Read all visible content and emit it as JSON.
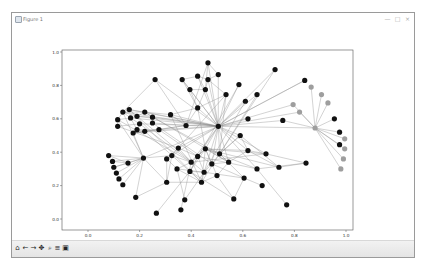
{
  "window": {
    "title": "Figure 1",
    "controls": {
      "minimize": "—",
      "maximize": "□",
      "close": "×"
    }
  },
  "toolbar": {
    "buttons": [
      {
        "name": "home",
        "icon": "home-icon",
        "glyph": "⌂"
      },
      {
        "name": "back",
        "icon": "back-arrow-icon",
        "glyph": "←"
      },
      {
        "name": "forward",
        "icon": "forward-arrow-icon",
        "glyph": "→"
      },
      {
        "name": "pan",
        "icon": "pan-icon",
        "glyph": "✥"
      },
      {
        "name": "zoom",
        "icon": "zoom-icon",
        "glyph": "⌕"
      },
      {
        "name": "subplots",
        "icon": "subplots-configure-icon",
        "glyph": "≡"
      },
      {
        "name": "save",
        "icon": "save-icon",
        "glyph": "▣"
      }
    ]
  },
  "colors": {
    "node_dark": "#111111",
    "node_gray": "#9e9e9e",
    "edge": "#8c8c8c",
    "axes_frame": "#555555"
  },
  "chart_data": {
    "type": "scatter",
    "title": "",
    "xlabel": "",
    "ylabel": "",
    "xlim": [
      -0.1,
      1.03
    ],
    "ylim": [
      -0.06,
      1.01
    ],
    "xticks": [
      "0.0",
      "0.2",
      "0.4",
      "0.6",
      "0.8",
      "1.0"
    ],
    "yticks": [
      "0.0",
      "0.2",
      "0.4",
      "0.6",
      "0.8",
      "1.0"
    ],
    "grid": false,
    "legend": null,
    "nodes": [
      {
        "id": 0,
        "x": 0.505,
        "y": 0.555,
        "color": "dark"
      },
      {
        "id": 1,
        "x": 0.465,
        "y": 0.935,
        "color": "dark"
      },
      {
        "id": 2,
        "x": 0.365,
        "y": 0.835,
        "color": "dark"
      },
      {
        "id": 3,
        "x": 0.425,
        "y": 0.855,
        "color": "dark"
      },
      {
        "id": 4,
        "x": 0.505,
        "y": 0.865,
        "color": "dark"
      },
      {
        "id": 5,
        "x": 0.395,
        "y": 0.775,
        "color": "dark"
      },
      {
        "id": 6,
        "x": 0.465,
        "y": 0.835,
        "color": "dark"
      },
      {
        "id": 7,
        "x": 0.455,
        "y": 0.775,
        "color": "dark"
      },
      {
        "id": 8,
        "x": 0.26,
        "y": 0.835,
        "color": "dark"
      },
      {
        "id": 9,
        "x": 0.425,
        "y": 0.665,
        "color": "dark"
      },
      {
        "id": 10,
        "x": 0.585,
        "y": 0.805,
        "color": "dark"
      },
      {
        "id": 11,
        "x": 0.61,
        "y": 0.705,
        "color": "dark"
      },
      {
        "id": 12,
        "x": 0.725,
        "y": 0.895,
        "color": "dark"
      },
      {
        "id": 13,
        "x": 0.655,
        "y": 0.745,
        "color": "dark"
      },
      {
        "id": 14,
        "x": 0.535,
        "y": 0.745,
        "color": "dark"
      },
      {
        "id": 15,
        "x": 0.84,
        "y": 0.83,
        "color": "dark"
      },
      {
        "id": 16,
        "x": 0.455,
        "y": 0.42,
        "color": "dark"
      },
      {
        "id": 17,
        "x": 0.62,
        "y": 0.6,
        "color": "dark"
      },
      {
        "id": 18,
        "x": 0.755,
        "y": 0.59,
        "color": "dark"
      },
      {
        "id": 19,
        "x": 0.62,
        "y": 0.41,
        "color": "dark"
      },
      {
        "id": 20,
        "x": 0.59,
        "y": 0.5,
        "color": "dark"
      },
      {
        "id": 21,
        "x": 0.08,
        "y": 0.38,
        "color": "dark"
      },
      {
        "id": 22,
        "x": 0.095,
        "y": 0.345,
        "color": "dark"
      },
      {
        "id": 23,
        "x": 0.1,
        "y": 0.31,
        "color": "dark"
      },
      {
        "id": 24,
        "x": 0.11,
        "y": 0.275,
        "color": "dark"
      },
      {
        "id": 25,
        "x": 0.12,
        "y": 0.24,
        "color": "dark"
      },
      {
        "id": 26,
        "x": 0.135,
        "y": 0.205,
        "color": "dark"
      },
      {
        "id": 27,
        "x": 0.155,
        "y": 0.335,
        "color": "dark"
      },
      {
        "id": 28,
        "x": 0.215,
        "y": 0.365,
        "color": "dark"
      },
      {
        "id": 29,
        "x": 0.175,
        "y": 0.515,
        "color": "dark"
      },
      {
        "id": 30,
        "x": 0.325,
        "y": 0.38,
        "color": "dark"
      },
      {
        "id": 31,
        "x": 0.185,
        "y": 0.13,
        "color": "dark"
      },
      {
        "id": 32,
        "x": 0.265,
        "y": 0.035,
        "color": "dark"
      },
      {
        "id": 33,
        "x": 0.36,
        "y": 0.055,
        "color": "dark"
      },
      {
        "id": 34,
        "x": 0.375,
        "y": 0.115,
        "color": "dark"
      },
      {
        "id": 35,
        "x": 0.305,
        "y": 0.22,
        "color": "dark"
      },
      {
        "id": 36,
        "x": 0.69,
        "y": 0.39,
        "color": "dark"
      },
      {
        "id": 37,
        "x": 0.74,
        "y": 0.31,
        "color": "dark"
      },
      {
        "id": 38,
        "x": 0.655,
        "y": 0.3,
        "color": "dark"
      },
      {
        "id": 39,
        "x": 0.845,
        "y": 0.335,
        "color": "dark"
      },
      {
        "id": 40,
        "x": 0.675,
        "y": 0.2,
        "color": "dark"
      },
      {
        "id": 41,
        "x": 0.605,
        "y": 0.245,
        "color": "dark"
      },
      {
        "id": 42,
        "x": 0.565,
        "y": 0.12,
        "color": "dark"
      },
      {
        "id": 43,
        "x": 0.77,
        "y": 0.085,
        "color": "dark"
      },
      {
        "id": 44,
        "x": 0.135,
        "y": 0.64,
        "color": "dark"
      },
      {
        "id": 45,
        "x": 0.16,
        "y": 0.655,
        "color": "dark"
      },
      {
        "id": 46,
        "x": 0.115,
        "y": 0.595,
        "color": "dark"
      },
      {
        "id": 47,
        "x": 0.115,
        "y": 0.555,
        "color": "dark"
      },
      {
        "id": 48,
        "x": 0.165,
        "y": 0.605,
        "color": "dark"
      },
      {
        "id": 49,
        "x": 0.19,
        "y": 0.615,
        "color": "dark"
      },
      {
        "id": 50,
        "x": 0.22,
        "y": 0.64,
        "color": "dark"
      },
      {
        "id": 51,
        "x": 0.25,
        "y": 0.61,
        "color": "dark"
      },
      {
        "id": 52,
        "x": 0.2,
        "y": 0.57,
        "color": "dark"
      },
      {
        "id": 53,
        "x": 0.19,
        "y": 0.535,
        "color": "dark"
      },
      {
        "id": 54,
        "x": 0.25,
        "y": 0.575,
        "color": "dark"
      },
      {
        "id": 55,
        "x": 0.32,
        "y": 0.625,
        "color": "dark"
      },
      {
        "id": 56,
        "x": 0.38,
        "y": 0.56,
        "color": "dark"
      },
      {
        "id": 57,
        "x": 0.275,
        "y": 0.535,
        "color": "dark"
      },
      {
        "id": 58,
        "x": 0.22,
        "y": 0.525,
        "color": "dark"
      },
      {
        "id": 59,
        "x": 0.35,
        "y": 0.425,
        "color": "dark"
      },
      {
        "id": 60,
        "x": 0.4,
        "y": 0.34,
        "color": "dark"
      },
      {
        "id": 61,
        "x": 0.425,
        "y": 0.375,
        "color": "dark"
      },
      {
        "id": 62,
        "x": 0.395,
        "y": 0.285,
        "color": "dark"
      },
      {
        "id": 63,
        "x": 0.45,
        "y": 0.28,
        "color": "dark"
      },
      {
        "id": 64,
        "x": 0.44,
        "y": 0.22,
        "color": "dark"
      },
      {
        "id": 65,
        "x": 0.48,
        "y": 0.33,
        "color": "dark"
      },
      {
        "id": 66,
        "x": 0.51,
        "y": 0.39,
        "color": "dark"
      },
      {
        "id": 67,
        "x": 0.545,
        "y": 0.34,
        "color": "dark"
      },
      {
        "id": 68,
        "x": 0.5,
        "y": 0.26,
        "color": "dark"
      },
      {
        "id": 69,
        "x": 0.305,
        "y": 0.36,
        "color": "dark"
      },
      {
        "id": 70,
        "x": 0.345,
        "y": 0.3,
        "color": "dark"
      },
      {
        "id": 71,
        "x": 0.975,
        "y": 0.445,
        "color": "dark"
      },
      {
        "id": 72,
        "x": 0.975,
        "y": 0.52,
        "color": "dark"
      },
      {
        "id": 73,
        "x": 0.955,
        "y": 0.6,
        "color": "dark"
      },
      {
        "id": 74,
        "x": 0.88,
        "y": 0.545,
        "color": "gray"
      },
      {
        "id": 75,
        "x": 0.795,
        "y": 0.685,
        "color": "gray"
      },
      {
        "id": 76,
        "x": 0.82,
        "y": 0.64,
        "color": "gray"
      },
      {
        "id": 77,
        "x": 0.865,
        "y": 0.79,
        "color": "gray"
      },
      {
        "id": 78,
        "x": 0.905,
        "y": 0.745,
        "color": "gray"
      },
      {
        "id": 79,
        "x": 0.93,
        "y": 0.695,
        "color": "gray"
      },
      {
        "id": 80,
        "x": 0.995,
        "y": 0.48,
        "color": "gray"
      },
      {
        "id": 81,
        "x": 0.995,
        "y": 0.42,
        "color": "gray"
      },
      {
        "id": 82,
        "x": 0.99,
        "y": 0.36,
        "color": "gray"
      },
      {
        "id": 83,
        "x": 0.98,
        "y": 0.3,
        "color": "gray"
      }
    ],
    "edges": [
      [
        0,
        1
      ],
      [
        0,
        2
      ],
      [
        0,
        3
      ],
      [
        0,
        4
      ],
      [
        0,
        5
      ],
      [
        0,
        6
      ],
      [
        0,
        7
      ],
      [
        0,
        8
      ],
      [
        0,
        9
      ],
      [
        0,
        10
      ],
      [
        0,
        11
      ],
      [
        0,
        12
      ],
      [
        0,
        13
      ],
      [
        0,
        14
      ],
      [
        0,
        15
      ],
      [
        0,
        16
      ],
      [
        0,
        17
      ],
      [
        0,
        18
      ],
      [
        0,
        19
      ],
      [
        0,
        20
      ],
      [
        0,
        29
      ],
      [
        0,
        44
      ],
      [
        0,
        45
      ],
      [
        0,
        48
      ],
      [
        0,
        49
      ],
      [
        0,
        50
      ],
      [
        0,
        51
      ],
      [
        0,
        52
      ],
      [
        0,
        55
      ],
      [
        0,
        56
      ],
      [
        0,
        57
      ],
      [
        0,
        59
      ],
      [
        0,
        61
      ],
      [
        0,
        66
      ],
      [
        0,
        67
      ],
      [
        0,
        74
      ],
      [
        0,
        75
      ],
      [
        0,
        76
      ],
      [
        0,
        28
      ],
      [
        0,
        30
      ],
      [
        0,
        36
      ],
      [
        0,
        38
      ],
      [
        0,
        60
      ],
      [
        0,
        63
      ],
      [
        0,
        65
      ],
      [
        74,
        77
      ],
      [
        74,
        78
      ],
      [
        74,
        79
      ],
      [
        74,
        73
      ],
      [
        74,
        72
      ],
      [
        74,
        80
      ],
      [
        74,
        81
      ],
      [
        74,
        82
      ],
      [
        74,
        83
      ],
      [
        74,
        71
      ],
      [
        74,
        18
      ],
      [
        74,
        75
      ],
      [
        74,
        76
      ],
      [
        28,
        21
      ],
      [
        28,
        22
      ],
      [
        28,
        23
      ],
      [
        28,
        24
      ],
      [
        28,
        25
      ],
      [
        28,
        26
      ],
      [
        28,
        27
      ],
      [
        28,
        29
      ],
      [
        28,
        30
      ],
      [
        28,
        31
      ],
      [
        28,
        35
      ],
      [
        28,
        44
      ],
      [
        28,
        46
      ],
      [
        27,
        21
      ],
      [
        27,
        22
      ],
      [
        27,
        23
      ],
      [
        30,
        35
      ],
      [
        30,
        59
      ],
      [
        30,
        60
      ],
      [
        35,
        31
      ],
      [
        35,
        64
      ],
      [
        32,
        62
      ],
      [
        33,
        60
      ],
      [
        34,
        63
      ],
      [
        34,
        70
      ],
      [
        16,
        36
      ],
      [
        16,
        37
      ],
      [
        16,
        38
      ],
      [
        16,
        19
      ],
      [
        16,
        60
      ],
      [
        16,
        61
      ],
      [
        16,
        62
      ],
      [
        16,
        64
      ],
      [
        16,
        65
      ],
      [
        16,
        66
      ],
      [
        16,
        67
      ],
      [
        16,
        68
      ],
      [
        19,
        37
      ],
      [
        19,
        36
      ],
      [
        19,
        20
      ],
      [
        20,
        37
      ],
      [
        20,
        66
      ],
      [
        38,
        39
      ],
      [
        38,
        43
      ],
      [
        37,
        39
      ],
      [
        36,
        39
      ],
      [
        40,
        41
      ],
      [
        41,
        42
      ],
      [
        41,
        66
      ],
      [
        41,
        63
      ],
      [
        42,
        62
      ],
      [
        44,
        45
      ],
      [
        44,
        46
      ],
      [
        44,
        48
      ],
      [
        44,
        49
      ],
      [
        44,
        50
      ],
      [
        45,
        49
      ],
      [
        45,
        50
      ],
      [
        46,
        47
      ],
      [
        46,
        48
      ],
      [
        47,
        52
      ],
      [
        48,
        49
      ],
      [
        48,
        52
      ],
      [
        48,
        53
      ],
      [
        49,
        50
      ],
      [
        49,
        51
      ],
      [
        50,
        51
      ],
      [
        50,
        55
      ],
      [
        51,
        54
      ],
      [
        52,
        53
      ],
      [
        53,
        57
      ],
      [
        54,
        56
      ],
      [
        55,
        56
      ],
      [
        56,
        57
      ],
      [
        57,
        58
      ],
      [
        58,
        53
      ],
      [
        9,
        2
      ],
      [
        9,
        5
      ],
      [
        9,
        7
      ],
      [
        9,
        14
      ],
      [
        9,
        55
      ],
      [
        9,
        56
      ],
      [
        9,
        16
      ],
      [
        2,
        3
      ],
      [
        2,
        5
      ],
      [
        3,
        6
      ],
      [
        3,
        7
      ],
      [
        4,
        6
      ],
      [
        4,
        1
      ],
      [
        5,
        7
      ],
      [
        6,
        7
      ],
      [
        6,
        14
      ],
      [
        1,
        7
      ],
      [
        8,
        44
      ],
      [
        8,
        56
      ],
      [
        1,
        56
      ],
      [
        10,
        62
      ],
      [
        11,
        63
      ],
      [
        13,
        64
      ],
      [
        14,
        59
      ],
      [
        14,
        66
      ],
      [
        12,
        66
      ],
      [
        15,
        0
      ],
      [
        59,
        60
      ],
      [
        59,
        61
      ],
      [
        60,
        61
      ],
      [
        61,
        62
      ],
      [
        61,
        63
      ],
      [
        62,
        63
      ],
      [
        62,
        64
      ],
      [
        63,
        64
      ],
      [
        63,
        65
      ],
      [
        64,
        68
      ],
      [
        65,
        66
      ],
      [
        65,
        67
      ],
      [
        66,
        67
      ],
      [
        67,
        68
      ],
      [
        69,
        70
      ],
      [
        69,
        59
      ],
      [
        69,
        35
      ],
      [
        69,
        30
      ],
      [
        70,
        60
      ],
      [
        70,
        63
      ],
      [
        70,
        64
      ],
      [
        29,
        57
      ],
      [
        29,
        58
      ],
      [
        29,
        56
      ],
      [
        52,
        60
      ],
      [
        57,
        61
      ],
      [
        55,
        64
      ],
      [
        54,
        65
      ],
      [
        51,
        66
      ],
      [
        50,
        67
      ],
      [
        49,
        63
      ],
      [
        46,
        60
      ],
      [
        47,
        59
      ],
      [
        45,
        64
      ],
      [
        58,
        62
      ],
      [
        68,
        42
      ],
      [
        65,
        41
      ],
      [
        67,
        19
      ],
      [
        66,
        20
      ],
      [
        60,
        36
      ],
      [
        61,
        38
      ]
    ]
  }
}
